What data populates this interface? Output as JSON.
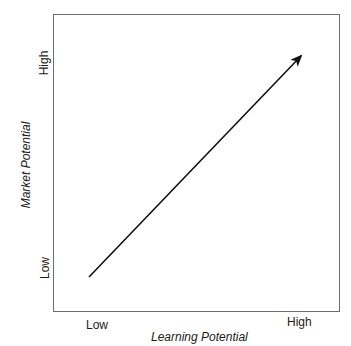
{
  "diagram": {
    "type": "arrow-matrix",
    "x_axis": {
      "label": "Learning Potential",
      "ticks": {
        "low": "Low",
        "high": "High"
      }
    },
    "y_axis": {
      "label": "Market Potential",
      "ticks": {
        "low": "Low",
        "high": "High"
      }
    },
    "arrow": {
      "from": "Low / Low",
      "to": "High / High",
      "color": "#111111"
    },
    "frame_color": "#6e6e6e"
  }
}
